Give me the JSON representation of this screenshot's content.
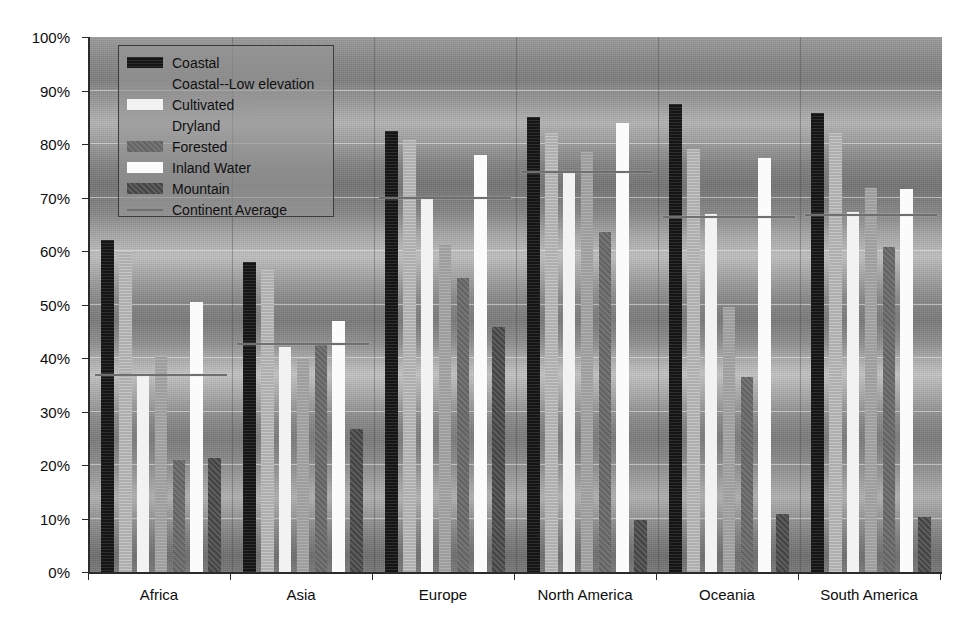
{
  "chart_data": {
    "type": "bar",
    "title": "",
    "subtitle": "",
    "xlabel": "",
    "ylabel": "",
    "ylim": [
      0,
      100
    ],
    "ytick_labels": [
      "0%",
      "10%",
      "20%",
      "30%",
      "40%",
      "50%",
      "60%",
      "70%",
      "80%",
      "90%",
      "100%"
    ],
    "ytick_values": [
      0,
      10,
      20,
      30,
      40,
      50,
      60,
      70,
      80,
      90,
      100
    ],
    "grid": true,
    "legend_position": "upper-left inside",
    "categories": [
      "Africa",
      "Asia",
      "Europe",
      "North America",
      "Oceania",
      "South America"
    ],
    "series": [
      {
        "name": "Coastal",
        "key": "coastal",
        "color": "#151515",
        "values": [
          62.0,
          58.0,
          82.5,
          85.0,
          87.5,
          85.8
        ]
      },
      {
        "name": "Coastal--Low elevation",
        "key": "coastal-low",
        "color": "#b9b9b9",
        "values": [
          60.0,
          56.5,
          80.8,
          82.0,
          79.0,
          82.0
        ]
      },
      {
        "name": "Cultivated",
        "key": "cultivated",
        "color": "#f2f2f2",
        "values": [
          37.0,
          42.0,
          70.0,
          74.5,
          67.0,
          67.3
        ]
      },
      {
        "name": "Dryland",
        "key": "dryland",
        "color": "#a5a5a5",
        "values": [
          40.3,
          40.0,
          61.3,
          78.5,
          49.5,
          71.8
        ]
      },
      {
        "name": "Forested",
        "key": "forested",
        "color": "#6a6a6a",
        "values": [
          21.0,
          42.5,
          55.0,
          63.5,
          36.5,
          60.8
        ]
      },
      {
        "name": "Inland Water",
        "key": "inland-water",
        "color": "#fbfbfb",
        "values": [
          50.5,
          47.0,
          78.0,
          84.0,
          77.3,
          71.5
        ]
      },
      {
        "name": "Mountain",
        "key": "mountain",
        "color": "#4a4a4a",
        "values": [
          21.3,
          26.8,
          45.8,
          9.8,
          10.8,
          10.3
        ]
      }
    ],
    "average_line": {
      "name": "Continent Average",
      "color": "#6f6f6f",
      "values": [
        36.7,
        42.5,
        69.8,
        74.5,
        66.2,
        66.5
      ]
    }
  },
  "legend": {
    "items": [
      {
        "label": "Coastal",
        "swatch": "coastal",
        "has_swatch": true
      },
      {
        "label": "Coastal--Low elevation",
        "swatch": "coastal-low",
        "has_swatch": false
      },
      {
        "label": "Cultivated",
        "swatch": "cultivated",
        "has_swatch": true
      },
      {
        "label": "Dryland",
        "swatch": "dryland",
        "has_swatch": false
      },
      {
        "label": "Forested",
        "swatch": "forested",
        "has_swatch": true
      },
      {
        "label": "Inland Water",
        "swatch": "inland-water",
        "has_swatch": true
      },
      {
        "label": "Mountain",
        "swatch": "mountain",
        "has_swatch": true
      },
      {
        "label": "Continent Average",
        "swatch": "line",
        "has_swatch": true
      }
    ]
  }
}
